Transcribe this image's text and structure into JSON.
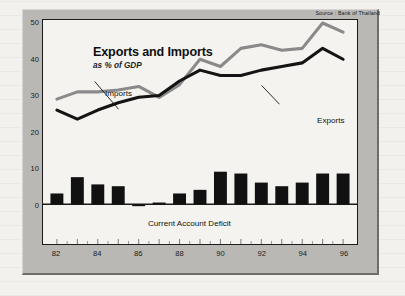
{
  "source_note": "Source : Bank of Thailand",
  "header": {
    "title": "Exports and Imports",
    "subtitle": "as % of GDP"
  },
  "annotations": {
    "imports": "Imports",
    "exports": "Exports",
    "bars": "Current Account Deficit"
  },
  "colors": {
    "imports_line": "#8a8a8a",
    "exports_line": "#141414",
    "bars": "#111111",
    "plot_background": "#f4f3f0",
    "frame": "#b9b8b5",
    "axis": "#1b1b1b"
  },
  "axes": {
    "y_ticks": [
      "0",
      "10",
      "20",
      "30",
      "40",
      "50"
    ],
    "x_ticks": [
      "82",
      "84",
      "86",
      "88",
      "90",
      "92",
      "94",
      "96"
    ]
  },
  "chart_data": {
    "type": "line",
    "title": "Exports and Imports",
    "subtitle": "as % of GDP",
    "xlabel": "",
    "ylabel": "as % of GDP",
    "ylim": [
      0,
      50
    ],
    "xlim": [
      1982,
      1996
    ],
    "grid": false,
    "legend": "inline-annotations",
    "source": "Source : Bank of Thailand",
    "x": [
      1982,
      1983,
      1984,
      1985,
      1986,
      1987,
      1988,
      1989,
      1990,
      1991,
      1992,
      1993,
      1994,
      1995,
      1996
    ],
    "x_tick_labels": [
      "82",
      "84",
      "86",
      "88",
      "90",
      "92",
      "94",
      "96"
    ],
    "series": [
      {
        "name": "Imports",
        "type": "line",
        "color": "#8a8a8a",
        "values": [
          29.0,
          31.0,
          31.0,
          31.5,
          32.5,
          29.5,
          33.0,
          40.0,
          38.0,
          43.0,
          44.0,
          42.5,
          43.0,
          50.0,
          47.5
        ]
      },
      {
        "name": "Exports",
        "type": "line",
        "color": "#141414",
        "values": [
          26.0,
          23.5,
          26.0,
          28.0,
          29.5,
          30.0,
          34.0,
          37.0,
          35.5,
          35.5,
          37.0,
          38.0,
          39.0,
          43.0,
          40.0
        ]
      },
      {
        "name": "Current Account Deficit",
        "type": "bar",
        "color": "#111111",
        "values": [
          3.0,
          7.5,
          5.5,
          5.0,
          -0.5,
          0.5,
          3.0,
          4.0,
          9.0,
          8.5,
          6.0,
          5.0,
          6.0,
          8.5,
          8.5
        ]
      }
    ]
  }
}
